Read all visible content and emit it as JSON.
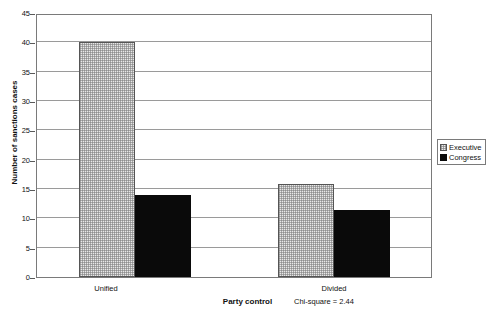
{
  "chart_data": {
    "type": "bar",
    "title": "",
    "xlabel": "Party control",
    "ylabel": "Number of sanctions cases",
    "categories": [
      "Unified",
      "Divided"
    ],
    "series": [
      {
        "name": "Executive",
        "values": [
          40,
          15.8
        ],
        "fill": "dotted-light-gray",
        "color": "#e8e8e8"
      },
      {
        "name": "Congress",
        "values": [
          14,
          11.5
        ],
        "fill": "solid-black",
        "color": "#0a0a0a"
      }
    ],
    "ylim": [
      0,
      45
    ],
    "ytick_step": 5,
    "yticks": [
      0,
      5,
      10,
      15,
      20,
      25,
      30,
      35,
      40,
      45
    ],
    "ytick_labels": [
      "0",
      "5",
      "10",
      "15",
      "20",
      "25",
      "30",
      "35",
      "40",
      "45"
    ],
    "grid": "horizontal",
    "legend_position": "right",
    "annotations": [
      {
        "text": "Chi-square = 2.44",
        "anchor": "below-divided-category"
      }
    ]
  },
  "legend": {
    "items": [
      {
        "label": "Executive",
        "swatch": "executive"
      },
      {
        "label": "Congress",
        "swatch": "congress"
      }
    ]
  },
  "axes": {
    "x_title": "Party control",
    "y_title": "Number of sanctions cases",
    "x_categories": [
      "Unified",
      "Divided"
    ]
  },
  "note": "Chi-square = 2.44"
}
